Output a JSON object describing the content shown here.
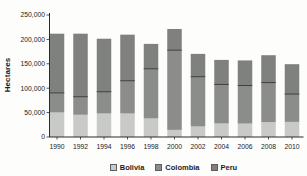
{
  "chart_data": {
    "type": "bar",
    "stacked": true,
    "title": "",
    "xlabel": "",
    "ylabel": "Hectares",
    "categories": [
      "1990",
      "1992",
      "1994",
      "1996",
      "1998",
      "2000",
      "2002",
      "2004",
      "2006",
      "2008",
      "2010"
    ],
    "series": [
      {
        "name": "Bolivia",
        "color": "#c8cac7",
        "values": [
          50300,
          45500,
          48100,
          48100,
          38000,
          14600,
          21600,
          27700,
          27500,
          30500,
          31000
        ]
      },
      {
        "name": "Colombia",
        "color": "#8b8d8a",
        "values": [
          40100,
          37100,
          44700,
          67200,
          101800,
          163300,
          102000,
          80000,
          78000,
          81000,
          57000
        ]
      },
      {
        "name": "Peru",
        "color": "#7f817e",
        "values": [
          121300,
          129100,
          108600,
          94400,
          51000,
          43400,
          46700,
          50300,
          51400,
          56100,
          61200
        ]
      }
    ],
    "ylim": [
      0,
      250000
    ],
    "ytick_interval": 50000,
    "ytick_labels": [
      "0",
      "50,000",
      "100,000",
      "150,000",
      "200,000",
      "250,000"
    ],
    "legend_position": "bottom",
    "legend_labels": [
      "Bolivia",
      "Colombia",
      "Peru"
    ],
    "grid": false,
    "divider_between": [
      "Colombia",
      "Peru"
    ],
    "colors": {
      "background": "#fdfdfb",
      "axis": "#2a2a2a",
      "text": "#1c1c1c",
      "divider": "#3e3e3e"
    }
  }
}
